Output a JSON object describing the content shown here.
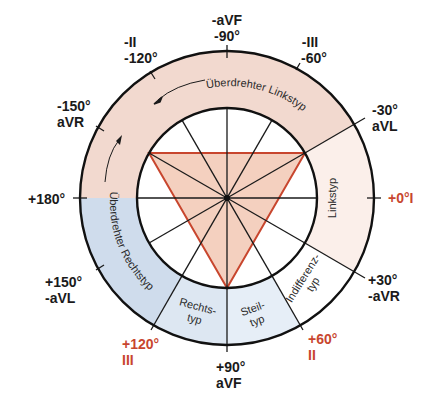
{
  "colors": {
    "outline": "#111111",
    "triangle": "#c8462e",
    "triangle_fill": "#f2c9b5",
    "left_overrotated_fill": "#f1d6cc",
    "right_overrotated_fill": "#c9d8ea",
    "linkstyp_fill": "#fbeee9",
    "steiltyp_fill": "#e4edf6",
    "rechtstyp_fill": "#dde7f2",
    "indifferenz_fill": "#ffffff",
    "highlight_label": "#c8462e"
  },
  "axis_labels": [
    {
      "id": "neg90",
      "line1": "-aVF",
      "line2": "-90°",
      "red": false
    },
    {
      "id": "neg60",
      "line1": "-III",
      "line2": "-60°",
      "red": false
    },
    {
      "id": "neg30",
      "line1": "-30°",
      "line2": "aVL",
      "red": false
    },
    {
      "id": "pos0",
      "line1": "+0°I",
      "line2": "",
      "red": true
    },
    {
      "id": "pos30",
      "line1": "+30°",
      "line2": "-aVR",
      "red": false
    },
    {
      "id": "pos60",
      "line1": "+60°",
      "line2": "II",
      "red": true
    },
    {
      "id": "pos90",
      "line1": "+90°",
      "line2": "aVF",
      "red": false
    },
    {
      "id": "pos120",
      "line1": "+120°",
      "line2": "III",
      "red": true
    },
    {
      "id": "pos150",
      "line1": "+150°",
      "line2": "-aVL",
      "red": false
    },
    {
      "id": "pos180",
      "line1": "+180°",
      "line2": "",
      "red": false
    },
    {
      "id": "neg150",
      "line1": "-150°",
      "line2": "aVR",
      "red": false
    },
    {
      "id": "neg120",
      "line1": "-II",
      "line2": "-120°",
      "red": false
    }
  ],
  "zones": {
    "ueberdrehter_linkstyp": "Überdrehter Linkstyp",
    "ueberdrehter_rechtstyp": "Überdrehter Rechtstyp",
    "linkstyp": "Linkstyp",
    "indifferenztyp_1": "Indifferenz-",
    "indifferenztyp_2": "typ",
    "steiltyp_1": "Steil-",
    "steiltyp_2": "typ",
    "rechtstyp_1": "Rechts-",
    "rechtstyp_2": "typ"
  }
}
